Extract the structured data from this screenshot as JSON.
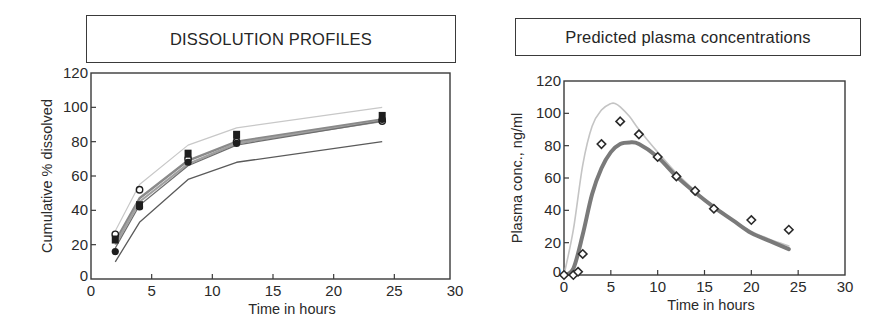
{
  "panels": {
    "left": {
      "title": "DISSOLUTION PROFILES"
    },
    "right": {
      "title": "Predicted plasma concentrations"
    }
  },
  "colors": {
    "axis": "#3a3a3a",
    "mean_band": "#8a8a8a",
    "upper_limit": "#c8c8c8",
    "lower_limit": "#5a5a5a",
    "markers": "#1e1e1e",
    "predicted_thick": "#7a7a7a",
    "predicted_light": "#c4c4c4"
  },
  "chart_data": [
    {
      "type": "line",
      "title": "DISSOLUTION PROFILES",
      "xlabel": "Time in hours",
      "ylabel": "Cumulative % dissolved",
      "xlim": [
        0,
        30
      ],
      "ylim": [
        0,
        120
      ],
      "xticks": [
        0,
        5,
        10,
        15,
        20,
        25,
        30
      ],
      "yticks": [
        0,
        20,
        40,
        60,
        80,
        100,
        120
      ],
      "grid": false,
      "x": [
        2,
        4,
        8,
        12,
        24
      ],
      "series": [
        {
          "name": "upper limit",
          "style": "thin light gray line",
          "values": [
            28,
            55,
            78,
            88,
            100
          ]
        },
        {
          "name": "mean profile 1",
          "style": "thick gray line",
          "values": [
            22,
            47,
            69,
            80,
            93
          ]
        },
        {
          "name": "mean profile 2",
          "style": "thick gray line",
          "values": [
            20,
            45,
            67,
            79,
            92
          ]
        },
        {
          "name": "mean profile 3",
          "style": "thin gray line",
          "values": [
            18,
            43,
            66,
            78,
            92
          ]
        },
        {
          "name": "lower limit",
          "style": "thin dark line",
          "values": [
            10,
            33,
            58,
            68,
            80
          ]
        },
        {
          "name": "observed (open circles)",
          "style": "markers",
          "values": [
            26,
            52,
            70,
            80,
            92
          ]
        },
        {
          "name": "observed (filled squares)",
          "style": "markers",
          "values": [
            23,
            43,
            73,
            84,
            95
          ]
        },
        {
          "name": "observed (filled circles)",
          "style": "markers",
          "values": [
            16,
            42,
            68,
            79,
            93
          ]
        }
      ]
    },
    {
      "type": "line",
      "title": "Predicted plasma concentrations",
      "xlabel": "Time in hours",
      "ylabel": "Plasma conc., ng/ml",
      "xlim": [
        0,
        30
      ],
      "ylim": [
        0,
        120
      ],
      "xticks": [
        0,
        5,
        10,
        15,
        20,
        25,
        30
      ],
      "yticks": [
        0,
        20,
        40,
        60,
        80,
        100,
        120
      ],
      "grid": false,
      "series": [
        {
          "name": "observed (diamonds)",
          "style": "open diamond markers",
          "x": [
            0,
            1,
            1.5,
            2,
            4,
            6,
            8,
            10,
            12,
            14,
            16,
            20,
            24
          ],
          "values": [
            0,
            0,
            2,
            13,
            81,
            95,
            87,
            73,
            61,
            52,
            41,
            34,
            28
          ]
        },
        {
          "name": "predicted (upper, light)",
          "style": "thin light gray curve",
          "x": [
            0,
            1,
            2,
            3,
            4,
            5,
            5.5,
            6,
            7,
            8,
            10,
            12,
            14,
            16,
            18,
            20,
            22,
            24
          ],
          "values": [
            0,
            28,
            68,
            92,
            102,
            106,
            106,
            104,
            98,
            90,
            76,
            63,
            52,
            42,
            34,
            27,
            22,
            18
          ]
        },
        {
          "name": "predicted (mean, thick)",
          "style": "thick gray curve",
          "x": [
            0,
            1,
            2,
            3,
            4,
            5,
            6,
            7,
            8,
            10,
            12,
            14,
            16,
            18,
            20,
            22,
            24
          ],
          "values": [
            0,
            4,
            25,
            50,
            66,
            76,
            81,
            82,
            81,
            73,
            61,
            51,
            42,
            34,
            26,
            21,
            16
          ]
        }
      ]
    }
  ]
}
